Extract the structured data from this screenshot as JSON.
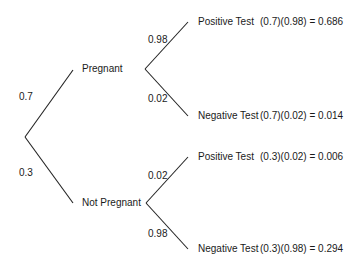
{
  "tree": {
    "root_branches": [
      {
        "prob": "0.7",
        "label": "Pregnant"
      },
      {
        "prob": "0.3",
        "label": "Not Pregnant"
      }
    ],
    "pregnant_branches": [
      {
        "prob": "0.98",
        "label": "Positive Test",
        "calc": "(0.7)(0.98) = 0.686"
      },
      {
        "prob": "0.02",
        "label": "Negative Test",
        "calc": "(0.7)(0.02) = 0.014"
      }
    ],
    "not_pregnant_branches": [
      {
        "prob": "0.02",
        "label": "Positive Test",
        "calc": "(0.3)(0.02) = 0.006"
      },
      {
        "prob": "0.98",
        "label": "Negative Test",
        "calc": "(0.3)(0.98) = 0.294"
      }
    ]
  }
}
